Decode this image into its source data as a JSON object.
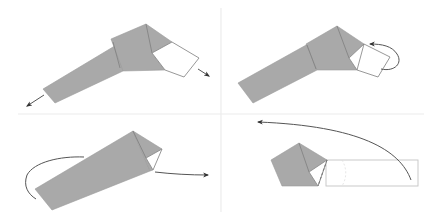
{
  "diagram": {
    "type": "origami folding instructions",
    "layout": "2x2 grid of steps",
    "colors": {
      "paper": "#a9a9a9",
      "paper_reverse": "#ffffff",
      "arrow": "#555555",
      "divider": "#ececec",
      "background": "#ffffff"
    },
    "steps": [
      {
        "id": 1,
        "position": "top-left",
        "description": "Pull the strip ends apart (outward arrows at both ends)",
        "arrows": [
          "arrow-pull-left",
          "arrow-pull-right"
        ]
      },
      {
        "id": 2,
        "position": "top-right",
        "description": "Fold the white square flap back behind (curved fold-behind arrow)",
        "arrows": [
          "arrow-fold-behind"
        ]
      },
      {
        "id": 3,
        "position": "bottom-left",
        "description": "Wrap strip around behind and pull tip to the right",
        "arrows": [
          "arrow-wrap-behind",
          "arrow-pull-right"
        ]
      },
      {
        "id": 4,
        "position": "bottom-right",
        "description": "Swing the long strip across to the left; dashed line marks fold",
        "arrows": [
          "arrow-swing-left"
        ]
      }
    ]
  }
}
